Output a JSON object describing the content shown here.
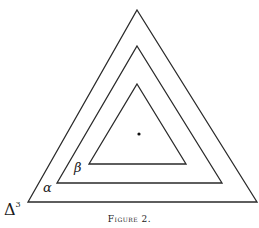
{
  "figure": {
    "caption": "Figure 2.",
    "labels": {
      "alpha": "α",
      "beta": "β",
      "delta": "Δ",
      "delta_sup": "3"
    },
    "triangles": [
      {
        "name": "outer",
        "points": "137,10 257,202 28,202"
      },
      {
        "name": "middle",
        "points": "137,46 222,183 57,183"
      },
      {
        "name": "inner",
        "points": "137,84 186,164 89,164"
      }
    ],
    "center_dot": {
      "x": 139,
      "y": 134
    },
    "line_color": "#2a2a2a"
  }
}
